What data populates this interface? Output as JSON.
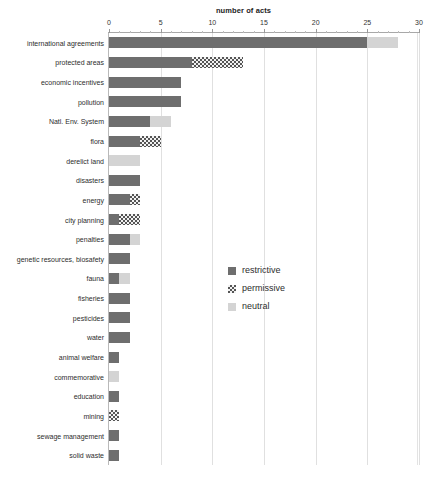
{
  "chart_data": {
    "type": "bar",
    "orientation": "horizontal",
    "stacked": true,
    "title": "",
    "xlabel": "number of acts",
    "ylabel": "",
    "xlim": [
      0,
      30
    ],
    "xticks": [
      0,
      5,
      10,
      15,
      20,
      25,
      30
    ],
    "xtick_labels": [
      "0",
      "5",
      "10",
      "15",
      "20",
      "25",
      "30"
    ],
    "minor_tick_step": 1,
    "grid": true,
    "grid_axis": "x",
    "legend_position": "center-right-inside",
    "categories": [
      "international agreements",
      "protected areas",
      "economic incentives",
      "pollution",
      "Natl. Env. System",
      "flora",
      "derelict land",
      "disasters",
      "energy",
      "city planning",
      "penalties",
      "genetic resources, biosafety",
      "fauna",
      "fisheries",
      "pesticides",
      "water",
      "animal welfare",
      "commemorative",
      "education",
      "mining",
      "sewage management",
      "solid waste"
    ],
    "series": [
      {
        "name": "restrictive",
        "color": "#6e6e6e",
        "pattern": "solid",
        "values": [
          25,
          8,
          7,
          7,
          4,
          3,
          0,
          3,
          2,
          1,
          2,
          2,
          1,
          2,
          2,
          2,
          1,
          0,
          1,
          0,
          1,
          1
        ]
      },
      {
        "name": "permissive",
        "color": "#555555",
        "pattern": "checkered",
        "values": [
          0,
          5,
          0,
          0,
          0,
          2,
          0,
          0,
          1,
          2,
          0,
          0,
          0,
          0,
          0,
          0,
          0,
          0,
          0,
          1,
          0,
          0
        ]
      },
      {
        "name": "neutral",
        "color": "#d4d4d4",
        "pattern": "solid",
        "values": [
          3,
          0,
          0,
          0,
          2,
          0,
          3,
          0,
          0,
          0,
          1,
          0,
          1,
          0,
          0,
          0,
          0,
          1,
          0,
          0,
          0,
          0
        ]
      }
    ],
    "totals": [
      28,
      13,
      7,
      7,
      6,
      5,
      3,
      3,
      3,
      3,
      3,
      2,
      2,
      2,
      2,
      2,
      1,
      1,
      1,
      1,
      1,
      1
    ]
  },
  "legend": {
    "items": [
      {
        "label": "restrictive"
      },
      {
        "label": "permissive"
      },
      {
        "label": "neutral"
      }
    ]
  }
}
